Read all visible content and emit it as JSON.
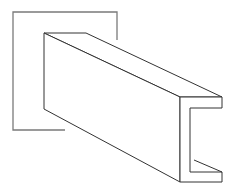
{
  "diagram": {
    "colors": {
      "background": "#ffffff",
      "frame_stroke": "#7a7a7a",
      "beam_stroke": "#333333"
    }
  }
}
